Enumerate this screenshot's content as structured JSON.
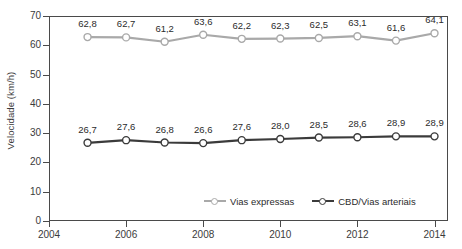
{
  "chart_data": {
    "type": "line",
    "title": "",
    "xlabel": "",
    "ylabel": "Velocidade (km/h)",
    "x": [
      2005,
      2006,
      2007,
      2008,
      2009,
      2010,
      2011,
      2012,
      2013,
      2014
    ],
    "xlim": [
      2004,
      2014.35
    ],
    "ylim": [
      0,
      70
    ],
    "xtick_labels": [
      "2004",
      "2006",
      "2008",
      "2010",
      "2012",
      "2014"
    ],
    "xticks": [
      2004,
      2006,
      2008,
      2010,
      2012,
      2014
    ],
    "ytick_labels": [
      "0",
      "10",
      "20",
      "30",
      "40",
      "50",
      "60",
      "70"
    ],
    "yticks": [
      0,
      10,
      20,
      30,
      40,
      50,
      60,
      70
    ],
    "grid": false,
    "legend_position": "bottom-right-inside",
    "decimal_separator": ",",
    "series": [
      {
        "name": "Vias expressas",
        "color": "#a9a9a9",
        "marker": "open-circle",
        "values": [
          62.8,
          62.7,
          61.2,
          63.6,
          62.2,
          62.3,
          62.5,
          63.1,
          61.6,
          64.1
        ],
        "labels": [
          "62,8",
          "62,7",
          "61,2",
          "63,6",
          "62,2",
          "62,3",
          "62,5",
          "63,1",
          "61,6",
          "64,1"
        ]
      },
      {
        "name": "CBD/Vias arteriais",
        "color": "#3b3b3b",
        "marker": "open-circle",
        "values": [
          26.7,
          27.6,
          26.8,
          26.6,
          27.6,
          28.0,
          28.5,
          28.6,
          28.9,
          28.9
        ],
        "labels": [
          "26,7",
          "27,6",
          "26,8",
          "26,6",
          "27,6",
          "28,0",
          "28,5",
          "28,6",
          "28,9",
          "28,9"
        ]
      }
    ]
  },
  "legend": {
    "entries": [
      {
        "label": "Vias expressas",
        "color": "#a9a9a9"
      },
      {
        "label": "CBD/Vias arteriais",
        "color": "#3b3b3b"
      }
    ]
  },
  "axes": {
    "y_title": "Velocidade (km/h)",
    "axis_color": "#4a4a4a"
  }
}
